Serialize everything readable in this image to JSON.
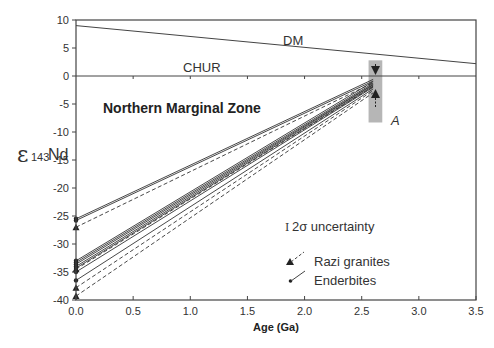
{
  "chart_data": {
    "type": "line",
    "title": "",
    "annotation_title": "Northern Marginal Zone",
    "xlabel": "Age (Ga)",
    "ylabel": "ε143Nd",
    "ylabel_parts": {
      "symbol": "ε",
      "sub": "143",
      "element": "Nd"
    },
    "xlim": [
      0,
      3.5
    ],
    "ylim": [
      -40,
      10
    ],
    "x_ticks": [
      "0.0",
      "0.5",
      "1.0",
      "1.5",
      "2.0",
      "2.5",
      "3.0",
      "3.5"
    ],
    "y_ticks": [
      "10",
      "5",
      "0",
      "-5",
      "-10",
      "-15",
      "-20",
      "-25",
      "-30",
      "-35",
      "-40"
    ],
    "grid": false,
    "reference_lines": [
      {
        "name": "DM",
        "points": [
          [
            0,
            9
          ],
          [
            3.5,
            2.2
          ]
        ]
      },
      {
        "name": "CHUR",
        "points": [
          [
            0,
            0
          ],
          [
            3.5,
            0
          ]
        ]
      }
    ],
    "annotations": [
      {
        "text": "A",
        "x": 2.72,
        "y": -9.5
      },
      {
        "text": "2σ uncertainty"
      }
    ],
    "highlight_band": {
      "x": [
        2.56,
        2.68
      ],
      "y": [
        -8.3,
        2.8
      ],
      "color": "#a9a9a9"
    },
    "series": [
      {
        "name": "Enderbites",
        "style": "solid",
        "marker": "dot",
        "lines": [
          {
            "start": -25.5,
            "end": -0.6
          },
          {
            "start": -25.8,
            "end": -0.9
          },
          {
            "start": -33.0,
            "end": -1.0
          },
          {
            "start": -33.3,
            "end": -1.3
          },
          {
            "start": -33.6,
            "end": -1.5
          },
          {
            "start": -34.0,
            "end": -1.6
          },
          {
            "start": -34.3,
            "end": -1.8
          },
          {
            "start": -35.0,
            "end": -2.0
          },
          {
            "start": -36.5,
            "end": -2.3
          }
        ]
      },
      {
        "name": "Razi granites",
        "style": "dashed",
        "marker": "triangle",
        "lines": [
          {
            "start": -27.0,
            "end": -1.2
          },
          {
            "start": -34.5,
            "end": -1.9
          },
          {
            "start": -37.8,
            "end": -2.6
          },
          {
            "start": -39.3,
            "end": -3.0
          }
        ]
      }
    ],
    "end_age": 2.6,
    "legend": [
      {
        "label": "Razi granites",
        "marker": "triangle",
        "style": "dashed"
      },
      {
        "label": "Enderbites",
        "marker": "dot",
        "style": "solid"
      }
    ],
    "legend_position": "lower-right"
  },
  "labels": {
    "dm": "DM",
    "chur": "CHUR",
    "zone": "Northern Marginal Zone",
    "a": "A",
    "uncertainty_symbol": "I",
    "uncertainty": "2σ uncertainty",
    "legend_razi": "Razi granites",
    "legend_enderbites": "Enderbites",
    "xlabel": "Age (Ga)",
    "ylab_symbol": "ε",
    "ylab_sub": "143",
    "ylab_nd": "Nd"
  },
  "colors": {
    "axis": "#444444",
    "line": "#333333",
    "band": "#a9a9a9"
  }
}
